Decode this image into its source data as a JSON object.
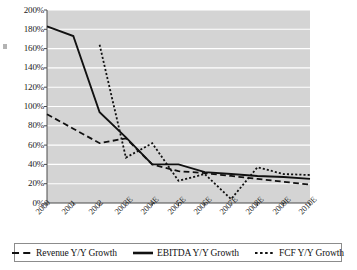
{
  "chart_data": {
    "type": "line",
    "title": "",
    "subtitle": "",
    "xlabel": "",
    "ylabel": "",
    "categories": [
      "2000",
      "2001",
      "2002",
      "2003E",
      "2004E",
      "2005E",
      "2006E",
      "2007E",
      "2008E",
      "2009E",
      "2010E"
    ],
    "ylim": [
      0,
      200
    ],
    "ytick_labels": [
      "200%",
      "180%",
      "160%",
      "140%",
      "120%",
      "100%",
      "80%",
      "60%",
      "40%",
      "20%",
      "0%"
    ],
    "ytick_values": [
      200,
      180,
      160,
      140,
      120,
      100,
      80,
      60,
      40,
      20,
      0
    ],
    "ytick_step": 20,
    "grid": true,
    "grid_color": "#ffffff",
    "plot_background": "#d4d4d4",
    "legend_position": "bottom",
    "series": [
      {
        "name": "Revenue Y/Y Growth",
        "style": "dashed",
        "color": "#111111",
        "values": [
          92,
          77,
          62,
          67,
          40,
          33,
          31,
          28,
          25,
          22,
          19
        ]
      },
      {
        "name": "EBITDA Y/Y Growth",
        "style": "solid",
        "color": "#111111",
        "values": [
          183,
          173,
          94,
          68,
          40,
          40,
          32,
          30,
          28,
          27,
          25
        ]
      },
      {
        "name": "FCF Y/Y Growth",
        "style": "dotted",
        "color": "#111111",
        "values": [
          null,
          null,
          164,
          47,
          62,
          23,
          30,
          4,
          37,
          30,
          29
        ]
      }
    ]
  },
  "legend": {
    "entries": [
      {
        "label": "Revenue Y/Y Growth",
        "style": "dashed"
      },
      {
        "label": "EBITDA Y/Y Growth",
        "style": "solid"
      },
      {
        "label": "FCF Y/Y Growth",
        "style": "dotted"
      }
    ]
  }
}
